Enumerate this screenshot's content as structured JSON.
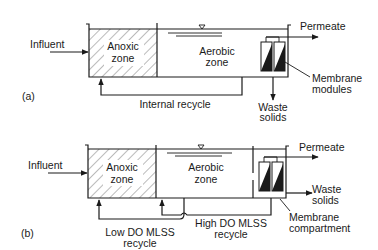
{
  "figure": {
    "panels": [
      {
        "id": "a",
        "label": "(a)",
        "influent": "Influent",
        "anoxic_line1": "Anoxic",
        "anoxic_line2": "zone",
        "aerobic_line1": "Aerobic",
        "aerobic_line2": "zone",
        "permeate": "Permeate",
        "membrane_line1": "Membrane",
        "membrane_line2": "modules",
        "waste_line1": "Waste",
        "waste_line2": "solids",
        "recycle": "Internal recycle"
      },
      {
        "id": "b",
        "label": "(b)",
        "influent": "Influent",
        "anoxic_line1": "Anoxic",
        "anoxic_line2": "zone",
        "aerobic_line1": "Aerobic",
        "aerobic_line2": "zone",
        "permeate": "Permeate",
        "membrane_line1": "Membrane",
        "membrane_line2": "compartment",
        "waste_line1": "Waste",
        "waste_line2": "solids",
        "low_recycle_line1": "Low DO MLSS",
        "low_recycle_line2": "recycle",
        "high_recycle_line1": "High DO MLSS",
        "high_recycle_line2": "recycle"
      }
    ],
    "icons": {
      "water_level": "water-level-triangle-icon",
      "membrane": "membrane-module-icon"
    },
    "colors": {
      "ink": "#1a1a1a",
      "background": "#ffffff"
    }
  }
}
